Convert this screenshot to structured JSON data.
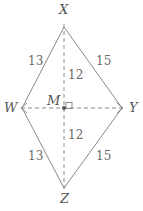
{
  "figure": {
    "kind": "geometry-diagram",
    "shape_name": "rhombus-WXYZ",
    "background_color": "#ffffff",
    "stroke_color": "#8a8a8a",
    "label_color": "#555555",
    "measure_color": "#6a6a6a",
    "canvas": {
      "width": 143,
      "height": 211
    }
  },
  "vertices": [
    {
      "id": "X",
      "label": "X",
      "x": 64,
      "y": 27,
      "label_x": 59,
      "label_y": 3,
      "role": "top-vertex"
    },
    {
      "id": "Y",
      "label": "Y",
      "x": 122,
      "y": 108,
      "label_x": 129,
      "label_y": 101,
      "role": "right-vertex"
    },
    {
      "id": "Z",
      "label": "Z",
      "x": 64,
      "y": 188,
      "label_x": 60,
      "label_y": 192,
      "role": "bottom-vertex"
    },
    {
      "id": "W",
      "label": "W",
      "x": 22,
      "y": 108,
      "label_x": 4,
      "label_y": 101,
      "role": "left-vertex"
    },
    {
      "id": "M",
      "label": "M",
      "x": 64,
      "y": 108,
      "label_x": 47,
      "label_y": 94,
      "role": "center-intersection"
    }
  ],
  "sides": [
    {
      "id": "WX",
      "from": "W",
      "to": "X",
      "style": "solid",
      "length_label": "13",
      "label_x": 28,
      "label_y": 55
    },
    {
      "id": "XY",
      "from": "X",
      "to": "Y",
      "style": "solid",
      "length_label": "15",
      "label_x": 96,
      "label_y": 55
    },
    {
      "id": "WZ",
      "from": "W",
      "to": "Z",
      "style": "solid",
      "length_label": "13",
      "label_x": 28,
      "label_y": 150
    },
    {
      "id": "ZY",
      "from": "Z",
      "to": "Y",
      "style": "solid",
      "length_label": "15",
      "label_x": 96,
      "label_y": 150
    }
  ],
  "diagonals": [
    {
      "id": "XZ",
      "from": "X",
      "to": "Z",
      "style": "dashed",
      "orientation": "vertical"
    },
    {
      "id": "WY",
      "from": "W",
      "to": "Y",
      "style": "dashed",
      "orientation": "horizontal",
      "arrow_ends": "both"
    }
  ],
  "segments": [
    {
      "id": "XM",
      "from": "X",
      "to": "M",
      "length_label": "12",
      "label_x": 68,
      "label_y": 69
    },
    {
      "id": "MZ",
      "from": "M",
      "to": "Z",
      "length_label": "12",
      "label_x": 68,
      "label_y": 129
    }
  ],
  "markers": [
    {
      "id": "right-angle-at-M",
      "type": "right-angle-square",
      "x": 66,
      "y": 103,
      "size": 6
    },
    {
      "id": "center-dot-M",
      "type": "dot",
      "x": 64,
      "y": 108,
      "radius": 2
    }
  ]
}
